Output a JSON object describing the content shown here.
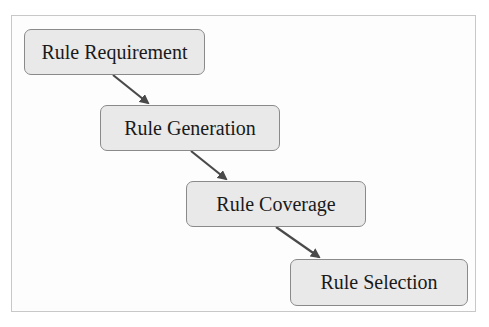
{
  "diagram": {
    "type": "flowchart-cascade",
    "nodes": [
      {
        "id": "n1",
        "label": "Rule Requirement"
      },
      {
        "id": "n2",
        "label": "Rule Generation"
      },
      {
        "id": "n3",
        "label": "Rule Coverage"
      },
      {
        "id": "n4",
        "label": "Rule Selection"
      }
    ],
    "edges": [
      {
        "from": "n1",
        "to": "n2"
      },
      {
        "from": "n2",
        "to": "n3"
      },
      {
        "from": "n3",
        "to": "n4"
      }
    ],
    "colors": {
      "node_fill": "#e9e9e9",
      "node_border": "#8a8a8a",
      "arrow": "#4a4a4a",
      "frame_border": "#c8c8c8"
    }
  }
}
